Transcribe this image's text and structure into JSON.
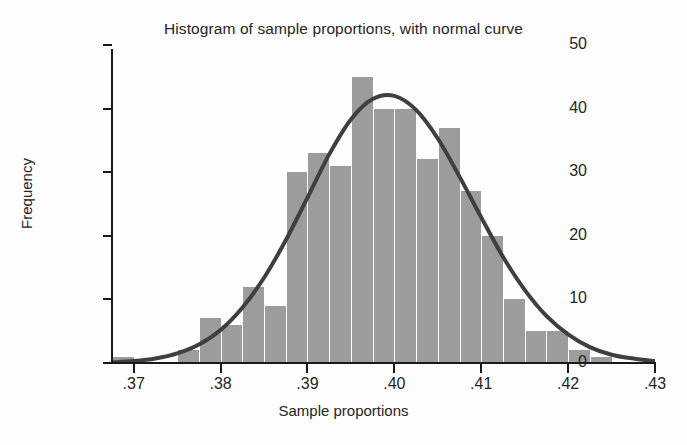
{
  "chart_data": {
    "type": "bar",
    "title": "Histogram of sample proportions, with normal curve",
    "xlabel": "Sample proportions",
    "ylabel": "Frequency",
    "xlim": [
      0.3675,
      0.43
    ],
    "ylim": [
      0,
      50
    ],
    "grid": false,
    "legend": "none",
    "bin_width": 0.0025,
    "bar_color": "#9c9c9c",
    "curve_color": "#3f3f3f",
    "x_tick_labels": [
      ".37",
      ".38",
      ".39",
      ".40",
      ".41",
      ".42",
      ".43"
    ],
    "x_tick_values": [
      0.37,
      0.38,
      0.39,
      0.4,
      0.41,
      0.42,
      0.43
    ],
    "y_tick_labels": [
      "0",
      "10",
      "20",
      "30",
      "40",
      "50"
    ],
    "y_tick_values": [
      0,
      10,
      20,
      30,
      40,
      50
    ],
    "bin_starts": [
      0.3675,
      0.37,
      0.3725,
      0.375,
      0.3775,
      0.38,
      0.3825,
      0.385,
      0.3875,
      0.39,
      0.3925,
      0.395,
      0.3975,
      0.4,
      0.4025,
      0.405,
      0.4075,
      0.41,
      0.4125,
      0.415,
      0.4175,
      0.42,
      0.4225,
      0.425,
      0.4275
    ],
    "bin_centers": [
      0.36875,
      0.37125,
      0.37375,
      0.37625,
      0.37875,
      0.38125,
      0.38375,
      0.38625,
      0.38875,
      0.39125,
      0.39375,
      0.39625,
      0.39875,
      0.40125,
      0.40375,
      0.40625,
      0.40875,
      0.41125,
      0.41375,
      0.41625,
      0.41875,
      0.42125,
      0.42375,
      0.42625,
      0.42875
    ],
    "values": [
      1,
      0,
      0,
      2,
      7,
      6,
      12,
      9,
      30,
      33,
      31,
      45,
      40,
      40,
      32,
      37,
      27,
      20,
      10,
      5,
      5,
      2,
      1,
      0,
      0
    ],
    "normal_curve": {
      "description": "normal curve overlaid on histogram",
      "mean": 0.4,
      "peak_frequency": 42,
      "sd": 0.0072,
      "points_x": [
        0.3675,
        0.37,
        0.3725,
        0.375,
        0.3775,
        0.38,
        0.3825,
        0.385,
        0.3875,
        0.39,
        0.3925,
        0.395,
        0.3975,
        0.4,
        0.4025,
        0.405,
        0.4075,
        0.41,
        0.4125,
        0.415,
        0.4175,
        0.42,
        0.4225,
        0.425,
        0.4275,
        0.43
      ],
      "points_y": [
        0.1,
        0.3,
        0.7,
        1.5,
        2.9,
        5.2,
        8.7,
        13.4,
        19.3,
        26.0,
        32.8,
        38.3,
        41.5,
        42.0,
        39.8,
        35.3,
        29.3,
        22.9,
        16.7,
        11.5,
        7.4,
        4.5,
        2.5,
        1.3,
        0.7,
        0.3
      ]
    }
  },
  "axis": {
    "title": "Histogram of sample proportions, with normal curve",
    "x_label": "Sample proportions",
    "y_label": "Frequency"
  }
}
